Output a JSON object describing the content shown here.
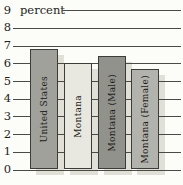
{
  "chart_data": {
    "type": "bar",
    "title": "",
    "xlabel": "",
    "ylabel": "percent",
    "categories": [
      "United States",
      "Montana",
      "Montana (Male)",
      "Montana (Female)"
    ],
    "values": [
      6.8,
      6.0,
      6.4,
      5.7
    ],
    "ylim": [
      0,
      9
    ],
    "yticks": [
      0,
      1,
      2,
      3,
      4,
      5,
      6,
      7,
      8,
      9
    ],
    "grid": true,
    "legend": "none",
    "bar_colors": [
      "#a1a19b",
      "#e9e8e0",
      "#92928c",
      "#b3b3ad"
    ],
    "bar_border_color": "#3c3c38",
    "shadow_color": "#e1e0d6",
    "gridline_color": "#4a4a46",
    "text_color": "#1e1e1c",
    "background_color": "#fcfcf8"
  }
}
